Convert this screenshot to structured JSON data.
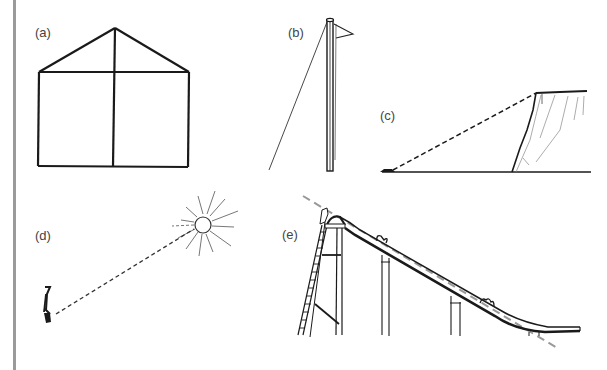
{
  "figure": {
    "panels": [
      {
        "id": "a",
        "label": "(a)",
        "subject": "house-frame",
        "description": "Rectangle with gabled triangular roof and a vertical center line"
      },
      {
        "id": "b",
        "label": "(b)",
        "subject": "flagpole",
        "description": "Tall flagpole with pennant flag and a diagonal guy wire"
      },
      {
        "id": "c",
        "label": "(c)",
        "subject": "cliff",
        "description": "Observer on ground with dashed line of sight to top of cliff"
      },
      {
        "id": "d",
        "label": "(d)",
        "subject": "sun-elevation",
        "description": "Person with dashed line of sight to the sun"
      },
      {
        "id": "e",
        "label": "(e)",
        "subject": "playground-slide",
        "description": "Slide with ladder, supports and dashed gray slope line"
      }
    ],
    "colors": {
      "ink": "#1a1a1a",
      "light_ink": "#777777",
      "dashed_gray": "#999999",
      "side_bar": "#9a9a9a",
      "background": "#ffffff"
    }
  }
}
